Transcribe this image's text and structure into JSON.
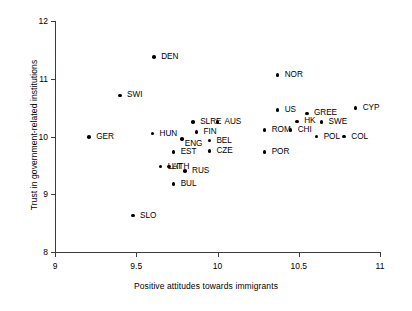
{
  "chart_data": {
    "type": "scatter",
    "title": "",
    "xlabel": "Positive attitudes towards immigrants",
    "ylabel": "Trust in government-related institutions",
    "xlim": [
      8.9,
      11.05
    ],
    "ylim": [
      7.9,
      12.1
    ],
    "xticks": [
      "9",
      "9.5",
      "10",
      "10.5",
      "11"
    ],
    "xtick_values": [
      9,
      9.5,
      10,
      10.5,
      11
    ],
    "yticks": [
      "8",
      "9",
      "10",
      "11",
      "12"
    ],
    "ytick_values": [
      8,
      9,
      10,
      11,
      12
    ],
    "grid": false,
    "legend": null,
    "point_label_field": "label",
    "points": [
      {
        "label": "DEN",
        "x": 9.61,
        "y": 11.38,
        "lx": 7,
        "ly": -4
      },
      {
        "label": "SWI",
        "x": 9.4,
        "y": 10.71,
        "lx": 7,
        "ly": -4
      },
      {
        "label": "NOR",
        "x": 10.37,
        "y": 11.06,
        "lx": 7,
        "ly": -4
      },
      {
        "label": "US",
        "x": 10.37,
        "y": 10.46,
        "lx": 7,
        "ly": -4
      },
      {
        "label": "GREE",
        "x": 10.55,
        "y": 10.4,
        "lx": 7,
        "ly": -4
      },
      {
        "label": "CYP",
        "x": 10.85,
        "y": 10.49,
        "lx": 7,
        "ly": -4
      },
      {
        "label": "HK",
        "x": 10.49,
        "y": 10.26,
        "lx": 7,
        "ly": -4
      },
      {
        "label": "SWE",
        "x": 10.64,
        "y": 10.25,
        "lx": 7,
        "ly": -4
      },
      {
        "label": "SLRE",
        "x": 9.85,
        "y": 10.25,
        "lx": 7,
        "ly": -4
      },
      {
        "label": "AUS",
        "x": 10.0,
        "y": 10.25,
        "lx": 7,
        "ly": -4
      },
      {
        "label": "HUN",
        "x": 9.6,
        "y": 10.05,
        "lx": 7,
        "ly": -4
      },
      {
        "label": "FIN",
        "x": 9.87,
        "y": 10.08,
        "lx": 7,
        "ly": -4
      },
      {
        "label": "ROM",
        "x": 10.29,
        "y": 10.11,
        "lx": 7,
        "ly": -4
      },
      {
        "label": "CHI",
        "x": 10.45,
        "y": 10.11,
        "lx": 7,
        "ly": -4
      },
      {
        "label": "GER",
        "x": 9.21,
        "y": 9.99,
        "lx": 7,
        "ly": -4
      },
      {
        "label": "ENG",
        "x": 9.78,
        "y": 9.96,
        "lx": 3,
        "ly": 1
      },
      {
        "label": "POL",
        "x": 10.61,
        "y": 10.0,
        "lx": 7,
        "ly": -4
      },
      {
        "label": "COL",
        "x": 10.78,
        "y": 10.0,
        "lx": 7,
        "ly": -4
      },
      {
        "label": "BEL",
        "x": 9.95,
        "y": 9.93,
        "lx": 7,
        "ly": -4
      },
      {
        "label": "EST",
        "x": 9.73,
        "y": 9.73,
        "lx": 7,
        "ly": -4
      },
      {
        "label": "CZE",
        "x": 9.95,
        "y": 9.75,
        "lx": 7,
        "ly": -4
      },
      {
        "label": "POR",
        "x": 10.29,
        "y": 9.73,
        "lx": 7,
        "ly": -4
      },
      {
        "label": "LAT",
        "x": 9.65,
        "y": 9.48,
        "lx": 7,
        "ly": -4
      },
      {
        "label": "LITH",
        "x": 9.7,
        "y": 9.48,
        "lx": 3,
        "ly": -4
      },
      {
        "label": "RUS",
        "x": 9.8,
        "y": 9.4,
        "lx": 7,
        "ly": -4
      },
      {
        "label": "BUL",
        "x": 9.73,
        "y": 9.18,
        "lx": 7,
        "ly": -4
      },
      {
        "label": "SLO",
        "x": 9.48,
        "y": 8.63,
        "lx": 7,
        "ly": -4
      }
    ]
  },
  "axes": {
    "x_title": "Positive attitudes towards immigrants",
    "y_title": "Trust in government-related institutions"
  }
}
